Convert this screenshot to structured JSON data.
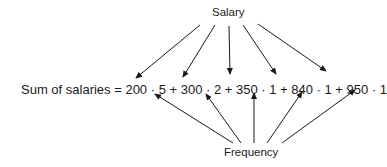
{
  "diagram": {
    "top_label": "Salary",
    "bottom_label": "Frequency",
    "equation": "Sum of salaries = 200 · 5 + 300 · 2 + 350 · 1 + 840 · 1 + 950 · 1",
    "terms": [
      {
        "salary": 200,
        "frequency": 5
      },
      {
        "salary": 300,
        "frequency": 2
      },
      {
        "salary": 350,
        "frequency": 1
      },
      {
        "salary": 840,
        "frequency": 1
      },
      {
        "salary": 950,
        "frequency": 1
      }
    ],
    "colors": {
      "ink": "#1a1a1a",
      "background": "#ffffff"
    }
  }
}
